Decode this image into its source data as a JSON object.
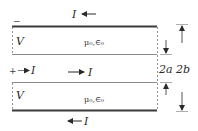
{
  "diagram": {
    "type": "parallel-plate transmission line cross-section",
    "labels": {
      "top_current": "I",
      "bottom_current": "I",
      "center_current": "I",
      "source_current": "I",
      "plus": "+",
      "minus": "−",
      "voltage_top": "V",
      "voltage_bottom": "V",
      "medium_top": "μ₀,∈₀",
      "medium_bottom": "μ₀,∈₀",
      "inner_sep": "2a",
      "outer_sep": "2b"
    },
    "colors": {
      "line": "#3a3a3a",
      "thin_line": "#8a8a8a",
      "text": "#2a2a2a"
    }
  }
}
